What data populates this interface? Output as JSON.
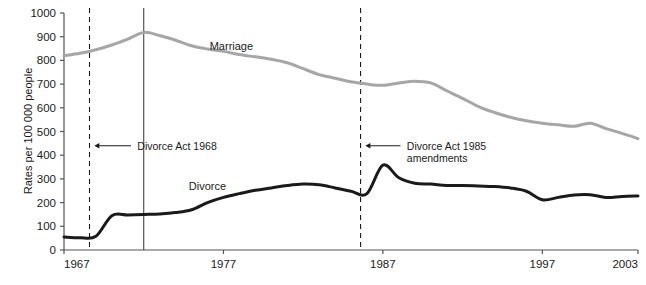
{
  "chart_data": {
    "type": "line",
    "title": "",
    "xlabel": "",
    "ylabel": "Rates per 100 000 people",
    "xlim": [
      1967,
      2003
    ],
    "ylim": [
      0,
      1000
    ],
    "grid": false,
    "legend_position": "inline-labels",
    "y_ticks": [
      0,
      100,
      200,
      300,
      400,
      500,
      600,
      700,
      800,
      900,
      1000
    ],
    "y_tick_labels": [
      "0",
      "100",
      "200",
      "300",
      "400",
      "500",
      "600",
      "700",
      "800",
      "900",
      "1000"
    ],
    "x_ticks": [
      1967,
      1977,
      1987,
      1997,
      2003
    ],
    "x_tick_labels": [
      "1967",
      "1977",
      "1987",
      "1997",
      "2003"
    ],
    "series": [
      {
        "name": "Marriage",
        "color": "#a6a6a6",
        "label_x": 1977.5,
        "label_y": 845,
        "x": [
          1967,
          1968,
          1969,
          1970,
          1971,
          1972,
          1973,
          1974,
          1975,
          1976,
          1977,
          1978,
          1979,
          1980,
          1981,
          1982,
          1983,
          1984,
          1985,
          1986,
          1987,
          1988,
          1989,
          1990,
          1991,
          1992,
          1993,
          1994,
          1995,
          1996,
          1997,
          1998,
          1999,
          2000,
          2001,
          2002,
          2003
        ],
        "values": [
          820,
          830,
          845,
          865,
          890,
          918,
          905,
          885,
          862,
          848,
          838,
          825,
          815,
          805,
          790,
          765,
          740,
          725,
          710,
          700,
          695,
          705,
          712,
          705,
          672,
          640,
          605,
          580,
          560,
          545,
          535,
          528,
          522,
          535,
          512,
          492,
          470
        ]
      },
      {
        "name": "Divorce",
        "color": "#1a1a1a",
        "label_x": 1976.0,
        "label_y": 252,
        "x": [
          1967,
          1968,
          1969,
          1970,
          1971,
          1972,
          1973,
          1974,
          1975,
          1976,
          1977,
          1978,
          1979,
          1980,
          1981,
          1982,
          1983,
          1984,
          1985,
          1986,
          1987,
          1988,
          1989,
          1990,
          1991,
          1992,
          1993,
          1994,
          1995,
          1996,
          1997,
          1998,
          1999,
          2000,
          2001,
          2002,
          2003
        ],
        "values": [
          55,
          52,
          58,
          145,
          148,
          150,
          152,
          158,
          170,
          200,
          222,
          238,
          252,
          262,
          272,
          278,
          275,
          262,
          248,
          238,
          358,
          305,
          282,
          278,
          272,
          272,
          270,
          268,
          262,
          248,
          212,
          222,
          232,
          233,
          222,
          226,
          228
        ]
      }
    ],
    "vertical_markers": [
      {
        "name": "divorce-act-1968-line",
        "x": 1968.6,
        "style": "dashed",
        "color": "#1a1a1a"
      },
      {
        "name": "solid-marker-line",
        "x": 1972.0,
        "style": "solid",
        "color": "#444444"
      },
      {
        "name": "divorce-act-1985-line",
        "x": 1985.6,
        "style": "dashed",
        "color": "#1a1a1a"
      }
    ],
    "annotations": [
      {
        "name": "divorce-act-1968-annotation",
        "lines": [
          "Divorce Act 1968"
        ],
        "text_x": 1971.6,
        "text_y": 440,
        "arrow_from_x": 1971.2,
        "arrow_to_x": 1968.9,
        "arrow_y": 440
      },
      {
        "name": "divorce-act-1985-annotation",
        "lines": [
          "Divorce Act 1985",
          "amendments"
        ],
        "text_x": 1988.5,
        "text_y": 440,
        "arrow_from_x": 1988.1,
        "arrow_to_x": 1985.9,
        "arrow_y": 440
      }
    ],
    "axis_color": "#555555",
    "background": "#ffffff"
  }
}
